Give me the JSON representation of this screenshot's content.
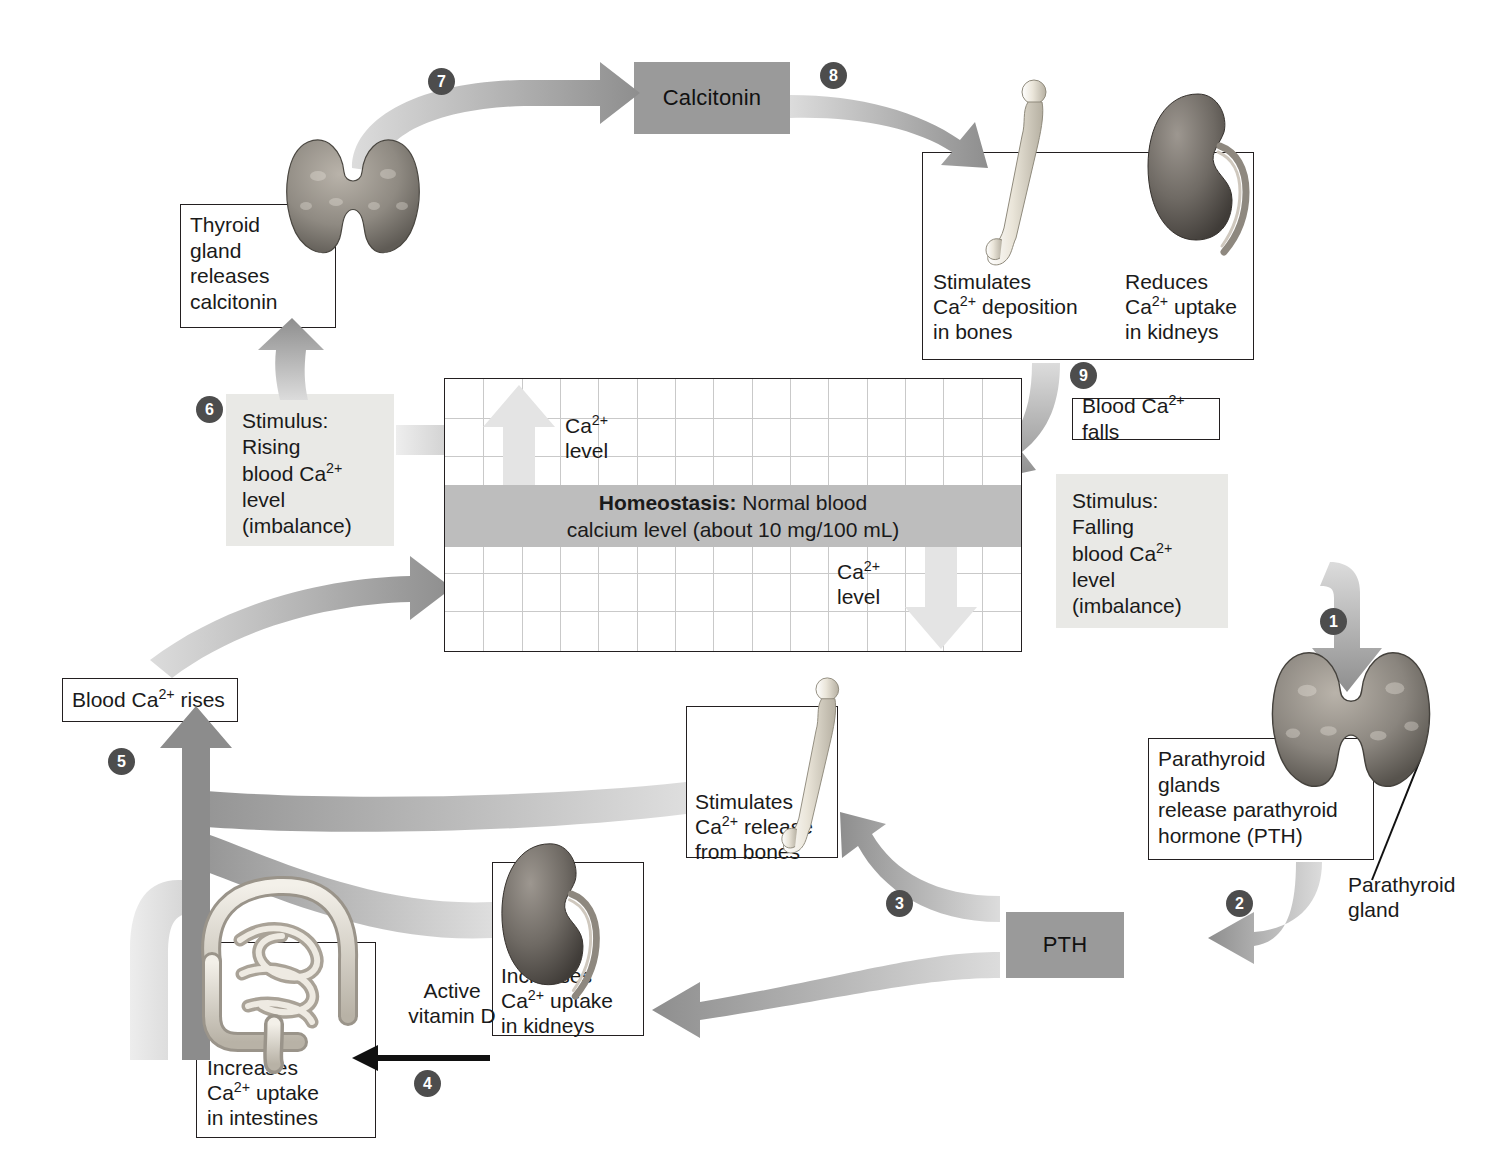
{
  "diagram": {
    "type": "homeostasis-feedback-loop",
    "colors": {
      "hormone_box_fill": "#9a9a9a",
      "stimulus_box_fill": "#e9e9e6",
      "homeostasis_band_fill": "#bdbdbd",
      "arrow_dark": "#8c8c8c",
      "arrow_pale": "#d9d9d9",
      "number_badge_fill": "#4d4d4d",
      "outline": "#231f20",
      "grid_line": "#c9c9c9"
    }
  },
  "homeostasis": {
    "band_bold": "Homeostasis:",
    "band_rest": " Normal blood",
    "band_line2": "calcium level (about 10 mg/100 mL)",
    "ca_label_top_line1": "Ca",
    "ca_label_top_sup": "2+",
    "ca_label_top_line2": "level",
    "ca_label_bottom_line1": "Ca",
    "ca_label_bottom_sup": "2+",
    "ca_label_bottom_line2": "level",
    "grid_columns": 15,
    "grid_rows": 7
  },
  "steps": [
    {
      "n": "1",
      "label": "1"
    },
    {
      "n": "2",
      "label": "2"
    },
    {
      "n": "3",
      "label": "3"
    },
    {
      "n": "4",
      "label": "4"
    },
    {
      "n": "5",
      "label": "5"
    },
    {
      "n": "6",
      "label": "6"
    },
    {
      "n": "7",
      "label": "7"
    },
    {
      "n": "8",
      "label": "8"
    },
    {
      "n": "9",
      "label": "9"
    }
  ],
  "boxes": {
    "thyroid_releases": {
      "line1": "Thyroid",
      "line2": "gland",
      "line3": "releases",
      "line4": "calcitonin"
    },
    "calcitonin_hormone": {
      "label": "Calcitonin"
    },
    "pth_hormone": {
      "label": "PTH"
    },
    "stimulus_rising": {
      "line1": "Stimulus:",
      "line2": "Rising",
      "line3_pre": "blood Ca",
      "line3_sup": "2+",
      "line4": "level",
      "line5": "(imbalance)"
    },
    "stimulus_falling": {
      "line1": "Stimulus:",
      "line2": "Falling",
      "line3_pre": "blood Ca",
      "line3_sup": "2+",
      "line4": "level",
      "line5": "(imbalance)"
    },
    "bone_deposition": {
      "line1": "Stimulates",
      "line2_pre": "Ca",
      "line2_sup": "2+",
      "line2_post": " deposition",
      "line3": "in bones"
    },
    "kidney_reduces": {
      "line1": "Reduces",
      "line2_pre": "Ca",
      "line2_sup": "2+",
      "line2_post": " uptake",
      "line3": "in kidneys"
    },
    "blood_ca_falls": {
      "pre": "Blood Ca",
      "sup": "2+",
      "post": " falls"
    },
    "blood_ca_rises": {
      "pre": "Blood Ca",
      "sup": "2+",
      "post": " rises"
    },
    "parathyroid_releases": {
      "line1": "Parathyroid",
      "line2": "glands",
      "line3": "release parathyroid",
      "line4": "hormone (PTH)"
    },
    "parathyroid_pointer": {
      "line1": "Parathyroid",
      "line2": "gland"
    },
    "bone_release": {
      "line1": "Stimulates",
      "line2_pre": "Ca",
      "line2_sup": "2+",
      "line2_post": " release",
      "line3": "from bones"
    },
    "kidney_increases": {
      "line1": "Increases",
      "line2_pre": "Ca",
      "line2_sup": "2+",
      "line2_post": " uptake",
      "line3": "in kidneys"
    },
    "intestine_increases": {
      "line1": "Increases",
      "line2_pre": "Ca",
      "line2_sup": "2+",
      "line2_post": " uptake",
      "line3": "in intestines"
    },
    "active_vitamin_d": {
      "line1": "Active",
      "line2": "vitamin D"
    }
  },
  "organs": {
    "thyroid_top": "thyroid-gland-illustration",
    "thyroid_bottom": "parathyroid-gland-illustration",
    "bone_top": "femur-bone-illustration",
    "bone_bottom": "femur-bone-illustration",
    "kidney_top": "kidney-illustration",
    "kidney_bottom": "kidney-illustration",
    "intestines": "intestines-illustration"
  }
}
